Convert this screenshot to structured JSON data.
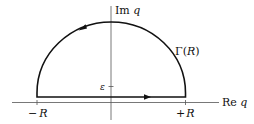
{
  "diagram": {
    "type": "contour-integral",
    "axes": {
      "imag_label_prefix": "Im",
      "imag_label_var": "q",
      "real_label_prefix": "Re",
      "real_label_var": "q"
    },
    "contour": {
      "label_prefix": "Γ(",
      "label_var": "R",
      "label_suffix": ")",
      "shape": "upper semicircle closed by segment shifted up by epsilon",
      "orientation": "counterclockwise"
    },
    "ticks": {
      "epsilon": "ε",
      "minus_R_sign": "−",
      "plus_R_sign": "+",
      "R": "R"
    },
    "colors": {
      "line": "#111111",
      "axis": "#555555",
      "background": "#ffffff"
    }
  }
}
